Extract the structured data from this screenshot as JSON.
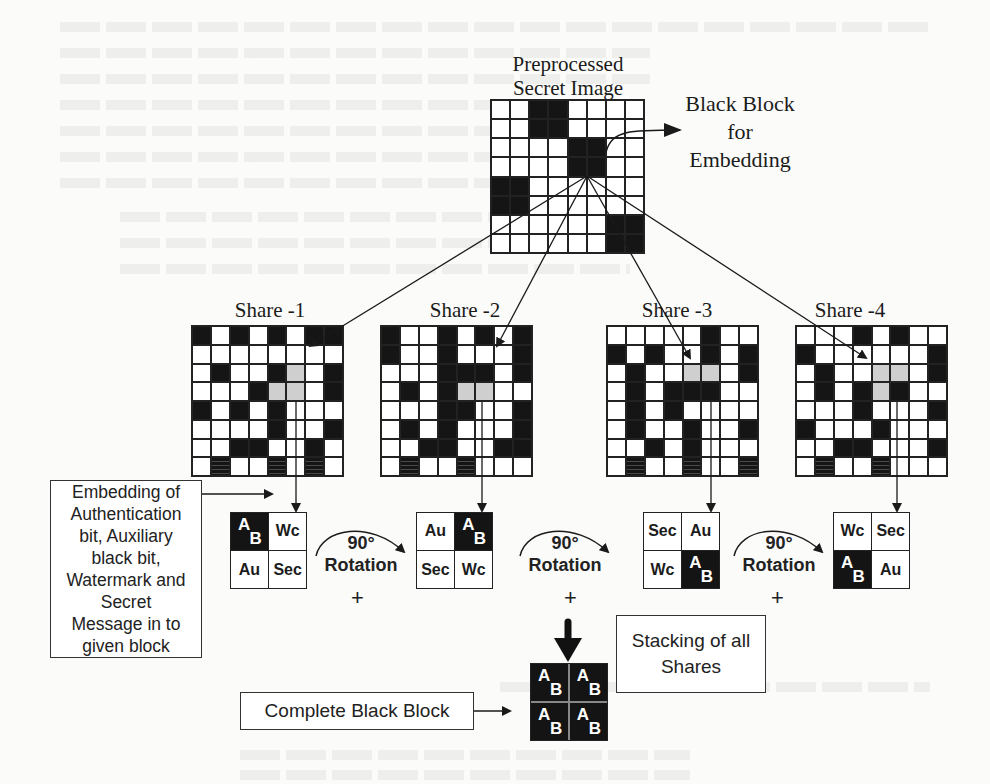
{
  "diagram": {
    "secret_image": {
      "title_line1": "Preprocessed",
      "title_line2": "Secret Image",
      "grid": [
        [
          0,
          0,
          1,
          1,
          0,
          0,
          0,
          0
        ],
        [
          0,
          0,
          1,
          1,
          0,
          0,
          0,
          0
        ],
        [
          0,
          0,
          0,
          0,
          1,
          1,
          0,
          0
        ],
        [
          0,
          0,
          0,
          0,
          1,
          1,
          0,
          0
        ],
        [
          1,
          1,
          0,
          0,
          0,
          0,
          0,
          0
        ],
        [
          1,
          1,
          0,
          0,
          0,
          0,
          0,
          0
        ],
        [
          0,
          0,
          0,
          0,
          0,
          0,
          1,
          1
        ],
        [
          0,
          0,
          0,
          0,
          0,
          0,
          1,
          1
        ]
      ]
    },
    "black_block_label": {
      "line1": "Black Block",
      "line2": "for",
      "line3": "Embedding"
    },
    "shares": [
      {
        "label": "Share -1",
        "grid": [
          [
            1,
            0,
            1,
            0,
            1,
            0,
            1,
            1
          ],
          [
            0,
            0,
            0,
            0,
            0,
            0,
            0,
            0
          ],
          [
            0,
            1,
            0,
            0,
            1,
            2,
            0,
            1
          ],
          [
            0,
            0,
            0,
            1,
            2,
            2,
            0,
            1
          ],
          [
            1,
            0,
            1,
            0,
            1,
            0,
            0,
            0
          ],
          [
            0,
            0,
            0,
            0,
            1,
            0,
            0,
            1
          ],
          [
            0,
            0,
            1,
            1,
            0,
            0,
            1,
            0
          ],
          [
            0,
            3,
            0,
            0,
            3,
            0,
            3,
            0
          ]
        ],
        "block": {
          "tl": "AB",
          "tr": "Wc",
          "bl": "Au",
          "br": "Sec"
        }
      },
      {
        "label": "Share -2",
        "grid": [
          [
            1,
            0,
            0,
            1,
            0,
            1,
            0,
            1
          ],
          [
            1,
            0,
            0,
            1,
            0,
            0,
            0,
            1
          ],
          [
            0,
            0,
            0,
            1,
            1,
            1,
            0,
            1
          ],
          [
            0,
            1,
            0,
            1,
            2,
            2,
            0,
            0
          ],
          [
            0,
            0,
            0,
            1,
            1,
            0,
            0,
            1
          ],
          [
            0,
            1,
            0,
            1,
            0,
            0,
            0,
            1
          ],
          [
            0,
            0,
            1,
            1,
            0,
            0,
            1,
            1
          ],
          [
            0,
            3,
            0,
            0,
            3,
            0,
            0,
            0
          ]
        ],
        "block": {
          "tl": "Au",
          "tr": "AB",
          "bl": "Sec",
          "br": "Wc"
        }
      },
      {
        "label": "Share -3",
        "grid": [
          [
            0,
            0,
            0,
            0,
            0,
            1,
            0,
            0
          ],
          [
            1,
            0,
            1,
            0,
            0,
            1,
            0,
            1
          ],
          [
            0,
            1,
            0,
            0,
            2,
            2,
            0,
            1
          ],
          [
            0,
            1,
            0,
            1,
            1,
            1,
            0,
            0
          ],
          [
            0,
            1,
            0,
            1,
            0,
            0,
            0,
            0
          ],
          [
            0,
            1,
            0,
            0,
            1,
            0,
            0,
            1
          ],
          [
            0,
            0,
            1,
            0,
            1,
            0,
            0,
            0
          ],
          [
            0,
            3,
            0,
            0,
            3,
            0,
            0,
            3
          ]
        ],
        "block": {
          "tl": "Sec",
          "tr": "Au",
          "bl": "Wc",
          "br": "AB"
        }
      },
      {
        "label": "Share -4",
        "grid": [
          [
            0,
            0,
            0,
            1,
            0,
            1,
            0,
            0
          ],
          [
            1,
            0,
            0,
            0,
            0,
            0,
            0,
            1
          ],
          [
            0,
            1,
            0,
            0,
            2,
            2,
            0,
            1
          ],
          [
            0,
            1,
            0,
            1,
            2,
            1,
            0,
            0
          ],
          [
            0,
            0,
            0,
            1,
            0,
            0,
            0,
            1
          ],
          [
            1,
            0,
            0,
            0,
            1,
            0,
            0,
            0
          ],
          [
            0,
            0,
            1,
            1,
            0,
            0,
            0,
            1
          ],
          [
            0,
            3,
            0,
            0,
            3,
            0,
            0,
            0
          ]
        ],
        "block": {
          "tl": "Wc",
          "tr": "Sec",
          "bl": "AB",
          "br": "Au"
        }
      }
    ],
    "rotation": {
      "angle": "90°",
      "label": "Rotation",
      "plus": "+"
    },
    "embedding_box": {
      "lines": [
        "Embedding of",
        "Authentication",
        "bit, Auxiliary",
        "black bit,",
        "Watermark and",
        "Secret",
        "Message in to",
        "given block"
      ]
    },
    "stacking_box": {
      "line1": "Stacking of all",
      "line2": "Shares"
    },
    "complete_box": {
      "label": "Complete Black Block"
    },
    "complete_block": {
      "a": "A",
      "b": "B"
    },
    "ab_letters": {
      "a": "A",
      "b": "B"
    },
    "colors": {
      "black": "#151515",
      "gray": "#cfcfcf",
      "white": "#ffffff",
      "line": "#222222"
    }
  }
}
